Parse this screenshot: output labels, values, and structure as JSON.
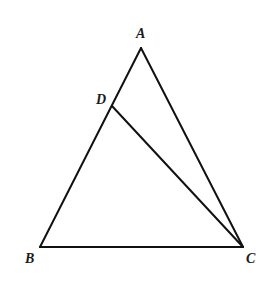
{
  "diagram": {
    "type": "geometry-triangle",
    "points": {
      "A": {
        "label": "A",
        "x": 141,
        "y": 48
      },
      "B": {
        "label": "B",
        "x": 40,
        "y": 247
      },
      "C": {
        "label": "C",
        "x": 243,
        "y": 247
      },
      "D": {
        "label": "D",
        "x": 112,
        "y": 106
      }
    },
    "labels": {
      "A": {
        "text": "A",
        "x": 136,
        "y": 38
      },
      "B": {
        "text": "B",
        "x": 25,
        "y": 263
      },
      "C": {
        "text": "C",
        "x": 246,
        "y": 263
      },
      "D": {
        "text": "D",
        "x": 96,
        "y": 104
      }
    },
    "segments": [
      {
        "from": "A",
        "to": "B"
      },
      {
        "from": "B",
        "to": "C"
      },
      {
        "from": "C",
        "to": "A"
      },
      {
        "from": "D",
        "to": "C"
      }
    ],
    "line_color": "#111111"
  }
}
